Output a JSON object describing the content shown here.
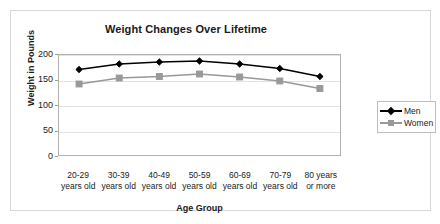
{
  "chart_data": {
    "type": "line",
    "title": "Weight Changes Over Lifetime",
    "xlabel": "Age Group",
    "ylabel": "Weight in Pounds",
    "categories": [
      "20-29 years old",
      "30-39 years old",
      "40-49 years old",
      "50-59 years old",
      "60-69 years old",
      "70-79 years old",
      "80 years or more"
    ],
    "category_lines": [
      [
        "20-29",
        "years old"
      ],
      [
        "30-39",
        "years old"
      ],
      [
        "40-49",
        "years old"
      ],
      [
        "50-59",
        "years old"
      ],
      [
        "60-69",
        "years old"
      ],
      [
        "70-79",
        "years old"
      ],
      [
        "80 years",
        "or more"
      ]
    ],
    "series": [
      {
        "name": "Men",
        "color": "#000000",
        "marker": "diamond",
        "values": [
          171,
          182,
          186,
          188,
          182,
          173,
          157
        ]
      },
      {
        "name": "Women",
        "color": "#999999",
        "marker": "square",
        "values": [
          142,
          154,
          157,
          162,
          156,
          148,
          133
        ]
      }
    ],
    "ylim": [
      0,
      200
    ],
    "yticks": [
      0,
      50,
      100,
      150,
      200
    ],
    "grid": true,
    "legend_position": "right"
  },
  "legend": {
    "entries": [
      {
        "label": "Men"
      },
      {
        "label": "Women"
      }
    ]
  }
}
